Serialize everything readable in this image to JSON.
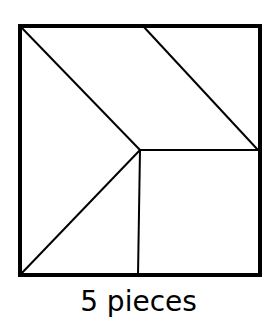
{
  "diagram": {
    "caption": "5 pieces",
    "stroke_color": "#000000",
    "background_color": "#ffffff",
    "outer_square": {
      "x1": 20,
      "y1": 26,
      "x2": 260,
      "y2": 275
    },
    "inner_lines": [
      {
        "id": "left-diagonal",
        "x1": 20,
        "y1": 26,
        "x2": 140,
        "y2": 150
      },
      {
        "id": "top-diagonal",
        "x1": 143,
        "y1": 26,
        "x2": 258,
        "y2": 150
      },
      {
        "id": "horizontal",
        "x1": 140,
        "y1": 150,
        "x2": 260,
        "y2": 150
      },
      {
        "id": "vertical",
        "x1": 140,
        "y1": 150,
        "x2": 138,
        "y2": 275
      },
      {
        "id": "bottom-diagonal",
        "x1": 140,
        "y1": 150,
        "x2": 20,
        "y2": 275
      }
    ],
    "piece_count": 5
  }
}
